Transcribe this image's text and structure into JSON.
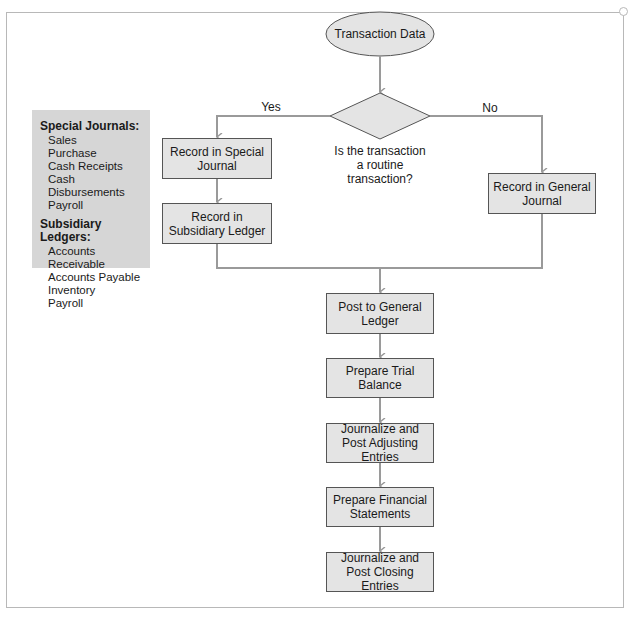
{
  "legend": {
    "special_journals": {
      "heading": "Special Journals:",
      "items": [
        "Sales",
        "Purchase",
        "Cash Receipts",
        "Cash Disbursements",
        "Payroll"
      ]
    },
    "subsidiary_ledgers": {
      "heading": "Subsidiary Ledgers:",
      "items": [
        "Accounts Receivable",
        "Accounts Payable",
        "Inventory",
        "Payroll"
      ]
    }
  },
  "flow": {
    "start": "Transaction Data",
    "decision": "Is the transaction a routine transaction?",
    "yes_label": "Yes",
    "no_label": "No",
    "yes_branch": [
      "Record in Special Journal",
      "Record in Subsidiary Ledger"
    ],
    "no_branch": [
      "Record in General Journal"
    ],
    "main_steps": [
      "Post to General Ledger",
      "Prepare Trial Balance",
      "Journalize and Post Adjusting Entries",
      "Prepare Financial Statements",
      "Journalize and Post Closing Entries"
    ]
  },
  "colors": {
    "box_fill": "#e4e4e4",
    "legend_fill": "#d6d6d6",
    "connector": "#9a9a9a",
    "frame": "#b8b8b8"
  }
}
